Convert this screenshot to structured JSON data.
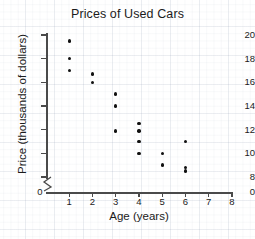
{
  "chart_data": {
    "type": "scatter",
    "title": "Prices of Used Cars",
    "xlabel": "Age (years)",
    "ylabel": "Price (thousands of dollars)",
    "xlim": [
      0,
      8
    ],
    "ylim": [
      8,
      20
    ],
    "y_axis_broken": true,
    "y_origin_label": "0",
    "grid": false,
    "xticks": [
      0,
      1,
      2,
      3,
      4,
      5,
      6,
      7,
      8
    ],
    "xtick_labels": [
      "0",
      "1",
      "2",
      "3",
      "4",
      "5",
      "6",
      "7",
      "8"
    ],
    "yticks": [
      8,
      10,
      12,
      14,
      16,
      18,
      20
    ],
    "ytick_labels": [
      "8",
      "10",
      "12",
      "14",
      "16",
      "18",
      "20"
    ],
    "point_color": "#111111",
    "axis_color": "#4a4a4a",
    "points": [
      {
        "x": 1,
        "y": 19.5
      },
      {
        "x": 1,
        "y": 18.0
      },
      {
        "x": 1,
        "y": 17.0
      },
      {
        "x": 2,
        "y": 16.7
      },
      {
        "x": 2,
        "y": 16.0
      },
      {
        "x": 3,
        "y": 15.0
      },
      {
        "x": 3,
        "y": 14.0
      },
      {
        "x": 3,
        "y": 11.9
      },
      {
        "x": 4,
        "y": 12.5
      },
      {
        "x": 4,
        "y": 11.9
      },
      {
        "x": 4,
        "y": 11.0
      },
      {
        "x": 4,
        "y": 10.0
      },
      {
        "x": 5,
        "y": 10.0
      },
      {
        "x": 5,
        "y": 9.0
      },
      {
        "x": 6,
        "y": 11.0
      },
      {
        "x": 6,
        "y": 8.8
      },
      {
        "x": 6,
        "y": 8.5
      }
    ]
  }
}
